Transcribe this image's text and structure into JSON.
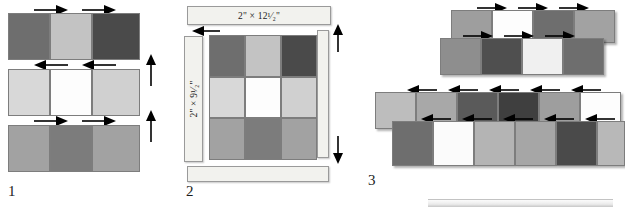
{
  "figure": {
    "background": "#ffffff"
  },
  "palette": {
    "dark": "#4a4a4a",
    "medium_dark": "#6e6e6e",
    "medium": "#8e8e8e",
    "light": "#c3c3c3",
    "pale": "#d8d8d8",
    "white": "#fdfdfd",
    "off_white": "#f2f2ee",
    "outline": "#7d7d7d",
    "text": "#111111"
  },
  "steps": [
    {
      "number": "1",
      "caption": "1",
      "rows": [
        {
          "name": "row-1",
          "seam_direction": "right",
          "squares": [
            {
              "color": "#6e6e6e",
              "tone": "medium-dark"
            },
            {
              "color": "#c3c3c3",
              "tone": "light"
            },
            {
              "color": "#4a4a4a",
              "tone": "dark"
            }
          ]
        },
        {
          "name": "row-2",
          "seam_direction": "left",
          "squares": [
            {
              "color": "#d8d8d8",
              "tone": "pale"
            },
            {
              "color": "#fdfdfd",
              "tone": "white"
            },
            {
              "color": "#d0d0d0",
              "tone": "pale"
            }
          ]
        },
        {
          "name": "row-3",
          "seam_direction": "right",
          "squares": [
            {
              "color": "#a2a2a2",
              "tone": "medium"
            },
            {
              "color": "#7c7c7c",
              "tone": "medium-dark"
            },
            {
              "color": "#a2a2a2",
              "tone": "medium"
            }
          ]
        }
      ],
      "edge_arrows": [
        {
          "name": "press-arrow-up-upper",
          "direction": "up"
        },
        {
          "name": "press-arrow-up-lower",
          "direction": "up"
        }
      ]
    },
    {
      "number": "2",
      "caption": "2",
      "measurements": {
        "horizontal": "2\" × 12¹⁄₂\"",
        "vertical": "2\" × 9¹⁄₂\""
      },
      "strips": [
        {
          "name": "strip-top",
          "label": "2\" × 12¹⁄₂\"",
          "orientation": "horizontal"
        },
        {
          "name": "strip-left",
          "label": "2\" × 9¹⁄₂\"",
          "orientation": "vertical"
        },
        {
          "name": "strip-right",
          "label": "",
          "orientation": "vertical"
        },
        {
          "name": "strip-bottom",
          "label": "",
          "orientation": "horizontal"
        }
      ],
      "grid": {
        "rows": 3,
        "cols": 3,
        "cells": [
          [
            "#6e6e6e",
            "#c3c3c3",
            "#4a4a4a"
          ],
          [
            "#d8d8d8",
            "#fdfdfd",
            "#d0d0d0"
          ],
          [
            "#a2a2a2",
            "#7c7c7c",
            "#a2a2a2"
          ]
        ]
      },
      "arrows": [
        {
          "name": "align-arrow-left",
          "direction": "left"
        },
        {
          "name": "align-arrow-up",
          "direction": "up"
        },
        {
          "name": "align-arrow-down",
          "direction": "down"
        }
      ]
    },
    {
      "number": "3",
      "caption": "3",
      "groups": [
        {
          "name": "strip-pair-upper",
          "top_row": {
            "seam_direction": "right",
            "squares": [
              "#9e9e9e",
              "#fdfdfd",
              "#6e6e6e",
              "#a2a2a2"
            ]
          },
          "bottom_row": {
            "seam_direction": "right",
            "squares": [
              "#8e8e8e",
              "#4f4f4f",
              "#f0f0f0",
              "#6e6e6e"
            ]
          }
        },
        {
          "name": "strip-pair-lower",
          "top_row": {
            "seam_direction": "left",
            "squares": [
              "#bdbdbd",
              "#a8a8a8",
              "#5a5a5a",
              "#3f3f3f",
              "#9e9e9e",
              "#fdfdfd"
            ]
          },
          "bottom_row": {
            "seam_direction": "left",
            "squares": [
              "#6e6e6e",
              "#fbfbfb",
              "#b4b4b4",
              "#a6a6a6",
              "#4a4a4a",
              "#b8b8b8"
            ]
          }
        }
      ]
    }
  ],
  "icons": {
    "arrow_right": "arrow-right-icon",
    "arrow_left": "arrow-left-icon",
    "arrow_up": "arrow-up-icon",
    "arrow_down": "arrow-down-icon"
  }
}
